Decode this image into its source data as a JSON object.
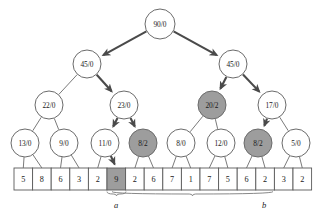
{
  "figure": {
    "type": "binary-tree-diagram",
    "colors": {
      "shaded_fill": "#9d9d9d",
      "plain_fill": "#ffffff",
      "node_stroke": "#6b6b6b",
      "bold_edge": "#4a4a4a",
      "thin_edge": "#6b6b6b"
    }
  },
  "tree": {
    "levels": [
      {
        "level": 0,
        "nodes": [
          {
            "id": "n0",
            "label": "90/0",
            "shaded": false,
            "cx": 160,
            "cy": 24,
            "r": 15
          }
        ]
      },
      {
        "level": 1,
        "nodes": [
          {
            "id": "n1",
            "label": "45/0",
            "shaded": false,
            "cx": 87,
            "cy": 64,
            "r": 14
          },
          {
            "id": "n2",
            "label": "45/0",
            "shaded": false,
            "cx": 233,
            "cy": 64,
            "r": 14
          }
        ]
      },
      {
        "level": 2,
        "nodes": [
          {
            "id": "n3",
            "label": "22/0",
            "shaded": false,
            "cx": 49,
            "cy": 105,
            "r": 14
          },
          {
            "id": "n4",
            "label": "23/0",
            "shaded": false,
            "cx": 124,
            "cy": 105,
            "r": 14
          },
          {
            "id": "n5",
            "label": "20/2",
            "shaded": true,
            "cx": 212,
            "cy": 105,
            "r": 14
          },
          {
            "id": "n6",
            "label": "17/0",
            "shaded": false,
            "cx": 272,
            "cy": 105,
            "r": 14
          }
        ]
      },
      {
        "level": 3,
        "nodes": [
          {
            "id": "n7",
            "label": "13/0",
            "shaded": false,
            "cx": 25,
            "cy": 143,
            "r": 14
          },
          {
            "id": "n8",
            "label": "9/0",
            "shaded": false,
            "cx": 64,
            "cy": 143,
            "r": 14
          },
          {
            "id": "n9",
            "label": "11/0",
            "shaded": false,
            "cx": 105,
            "cy": 143,
            "r": 14
          },
          {
            "id": "n10",
            "label": "8/2",
            "shaded": true,
            "cx": 143,
            "cy": 143,
            "r": 14
          },
          {
            "id": "n11",
            "label": "8/0",
            "shaded": false,
            "cx": 181,
            "cy": 143,
            "r": 14
          },
          {
            "id": "n12",
            "label": "12/0",
            "shaded": false,
            "cx": 221,
            "cy": 143,
            "r": 14
          },
          {
            "id": "n13",
            "label": "8/2",
            "shaded": true,
            "cx": 258,
            "cy": 143,
            "r": 14
          },
          {
            "id": "n14",
            "label": "5/0",
            "shaded": false,
            "cx": 296,
            "cy": 143,
            "r": 14
          }
        ]
      }
    ],
    "edges": [
      {
        "from": "n0",
        "to": "n1",
        "bold": true
      },
      {
        "from": "n0",
        "to": "n2",
        "bold": true
      },
      {
        "from": "n1",
        "to": "n3",
        "bold": false
      },
      {
        "from": "n1",
        "to": "n4",
        "bold": true
      },
      {
        "from": "n2",
        "to": "n5",
        "bold": true
      },
      {
        "from": "n2",
        "to": "n6",
        "bold": true
      },
      {
        "from": "n3",
        "to": "n7",
        "bold": false
      },
      {
        "from": "n3",
        "to": "n8",
        "bold": false
      },
      {
        "from": "n4",
        "to": "n9",
        "bold": true
      },
      {
        "from": "n4",
        "to": "n10",
        "bold": true
      },
      {
        "from": "n5",
        "to": "n11",
        "bold": false
      },
      {
        "from": "n5",
        "to": "n12",
        "bold": false
      },
      {
        "from": "n6",
        "to": "n13",
        "bold": true
      },
      {
        "from": "n6",
        "to": "n14",
        "bold": false
      }
    ]
  },
  "array": {
    "x": 14,
    "y": 168,
    "cell_width": 18.6,
    "cell_height": 22,
    "cells": [
      {
        "index": 0,
        "value": "5",
        "shaded": false
      },
      {
        "index": 1,
        "value": "8",
        "shaded": false
      },
      {
        "index": 2,
        "value": "6",
        "shaded": false
      },
      {
        "index": 3,
        "value": "3",
        "shaded": false
      },
      {
        "index": 4,
        "value": "2",
        "shaded": false
      },
      {
        "index": 5,
        "value": "9",
        "shaded": true
      },
      {
        "index": 6,
        "value": "2",
        "shaded": false
      },
      {
        "index": 7,
        "value": "6",
        "shaded": false
      },
      {
        "index": 8,
        "value": "7",
        "shaded": false
      },
      {
        "index": 9,
        "value": "1",
        "shaded": false
      },
      {
        "index": 10,
        "value": "7",
        "shaded": false
      },
      {
        "index": 11,
        "value": "5",
        "shaded": false
      },
      {
        "index": 12,
        "value": "6",
        "shaded": false
      },
      {
        "index": 13,
        "value": "2",
        "shaded": false
      },
      {
        "index": 14,
        "value": "3",
        "shaded": false
      },
      {
        "index": 15,
        "value": "2",
        "shaded": false
      }
    ],
    "leaf_links": [
      {
        "node": "n7",
        "cells": [
          0,
          1
        ]
      },
      {
        "node": "n8",
        "cells": [
          2,
          3
        ]
      },
      {
        "node": "n9",
        "cells": [
          4,
          5
        ]
      },
      {
        "node": "n10",
        "cells": [
          6,
          7
        ]
      },
      {
        "node": "n11",
        "cells": [
          8,
          9
        ]
      },
      {
        "node": "n12",
        "cells": [
          10,
          11
        ]
      },
      {
        "node": "n13",
        "cells": [
          12,
          13
        ]
      },
      {
        "node": "n14",
        "cells": [
          14,
          15
        ]
      }
    ],
    "bold_leaf_links": [
      {
        "node": "n9",
        "cell": 5
      }
    ]
  },
  "braces": [
    {
      "id": "brace-a",
      "label": "a",
      "x_start": 107,
      "x_end": 126,
      "y": 194,
      "label_x": 116,
      "label_y": 205
    },
    {
      "id": "brace-b",
      "label": "b",
      "x_start": 112,
      "x_end": 273,
      "y": 194,
      "label_x": 264,
      "label_y": 205
    }
  ]
}
